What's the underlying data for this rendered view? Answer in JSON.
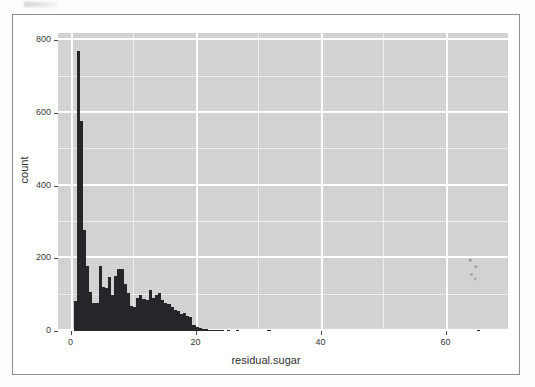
{
  "figure": {
    "kind": "ggplot2-histogram",
    "panel_background_color": "#d6d6d6",
    "grid_color": "#ffffff",
    "bar_color": "#26262a",
    "frame_color": "#8d8d8d",
    "text_color": "#3a3a3a"
  },
  "chart_data": {
    "type": "bar",
    "title": "",
    "subtitle": "",
    "xlabel": "residual.sugar",
    "ylabel": "count",
    "xlim": [
      -2,
      70
    ],
    "ylim": [
      0,
      820
    ],
    "xticks": [
      0,
      20,
      40,
      60
    ],
    "xtick_labels": [
      "0",
      "20",
      "40",
      "60"
    ],
    "yticks": [
      0,
      200,
      400,
      600,
      800
    ],
    "ytick_labels": [
      "0",
      "200",
      "400",
      "600",
      "800"
    ],
    "x_minor_ticks": [
      10,
      30,
      50
    ],
    "y_minor_ticks": [
      100,
      300,
      500,
      700
    ],
    "grid": true,
    "legend": "none",
    "bin_width": 0.5,
    "bin_starts": [
      0.5,
      1.0,
      1.5,
      2.0,
      2.5,
      3.0,
      3.5,
      4.0,
      4.5,
      5.0,
      5.5,
      6.0,
      6.5,
      7.0,
      7.5,
      8.0,
      8.5,
      9.0,
      9.5,
      10.0,
      10.5,
      11.0,
      11.5,
      12.0,
      12.5,
      13.0,
      13.5,
      14.0,
      14.5,
      15.0,
      15.5,
      16.0,
      16.5,
      17.0,
      17.5,
      18.0,
      18.5,
      19.0,
      19.5,
      20.0,
      20.5,
      21.0,
      21.5,
      22.0,
      22.5,
      23.0,
      23.5,
      24.0,
      25.0,
      26.5,
      31.5,
      65.0
    ],
    "values": [
      82,
      770,
      578,
      278,
      180,
      108,
      78,
      76,
      180,
      120,
      118,
      148,
      98,
      152,
      172,
      170,
      128,
      104,
      68,
      66,
      92,
      98,
      88,
      86,
      112,
      90,
      98,
      104,
      86,
      78,
      74,
      66,
      58,
      56,
      46,
      50,
      42,
      38,
      16,
      12,
      8,
      6,
      5,
      4,
      4,
      3,
      3,
      2,
      3,
      2,
      2,
      1
    ],
    "annotations": []
  }
}
